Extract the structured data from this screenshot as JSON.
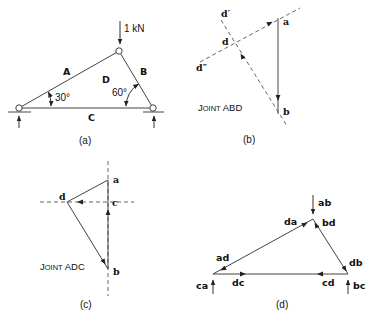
{
  "figure": {
    "panels": [
      {
        "id": "a",
        "caption": "(a)",
        "load_label": "1 kN",
        "space_labels": {
          "A": "A",
          "B": "B",
          "C": "C",
          "D": "D"
        },
        "angles": {
          "left": "30°",
          "right": "60°"
        }
      },
      {
        "id": "b",
        "caption": "(b)",
        "title_big1": "J",
        "title_small": "OINT",
        "title_rest": " ABD",
        "points": {
          "a": "a",
          "b": "b",
          "d": "d",
          "d_prime": "d′",
          "d_dprime": "d″"
        }
      },
      {
        "id": "c",
        "caption": "(c)",
        "title_big1": "J",
        "title_small": "OINT",
        "title_rest": " ADC",
        "points": {
          "a": "a",
          "b": "b",
          "c": "c",
          "d": "d"
        }
      },
      {
        "id": "d",
        "caption": "(d)",
        "labels": {
          "ab": "ab",
          "bd": "bd",
          "da": "da",
          "ad": "ad",
          "db": "db",
          "ca": "ca",
          "dc": "dc",
          "cd": "cd",
          "bc": "bc"
        }
      }
    ]
  },
  "colors": {
    "line": "#444444",
    "text": "#111111",
    "background": "#ffffff"
  }
}
